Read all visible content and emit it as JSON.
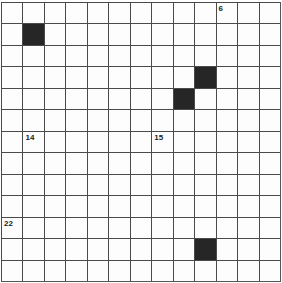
{
  "puzzle": {
    "type": "crossword-grid",
    "rows": 13,
    "cols": 13,
    "colors": {
      "grid_line": "#4a4a4a",
      "black_cell": "#262626",
      "white_cell": "#fdfdfd",
      "number": "#222222"
    },
    "black_cells": [
      {
        "row": 1,
        "col": 1
      },
      {
        "row": 3,
        "col": 9
      },
      {
        "row": 4,
        "col": 8
      },
      {
        "row": 11,
        "col": 9
      }
    ],
    "numbered_cells": [
      {
        "row": 0,
        "col": 10,
        "number": "6"
      },
      {
        "row": 6,
        "col": 1,
        "number": "14"
      },
      {
        "row": 6,
        "col": 7,
        "number": "15"
      },
      {
        "row": 10,
        "col": 0,
        "number": "22"
      }
    ]
  }
}
